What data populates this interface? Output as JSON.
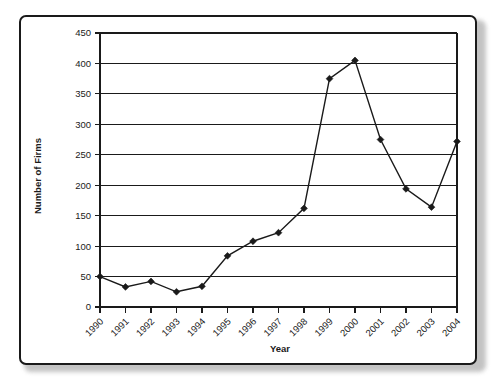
{
  "chart_data": {
    "type": "line",
    "title": "",
    "xlabel": "Year",
    "ylabel": "Number of Firms",
    "categories": [
      "1990",
      "1991",
      "1992",
      "1993",
      "1994",
      "1995",
      "1996",
      "1997",
      "1998",
      "1999",
      "2000",
      "2001",
      "2002",
      "2003",
      "2004"
    ],
    "values": [
      50,
      33,
      42,
      25,
      34,
      84,
      108,
      122,
      162,
      375,
      405,
      275,
      194,
      164,
      272
    ],
    "series": [
      {
        "name": "Number of Firms",
        "values": [
          50,
          33,
          42,
          25,
          34,
          84,
          108,
          122,
          162,
          375,
          405,
          275,
          194,
          164,
          272
        ]
      }
    ],
    "ylim": [
      0,
      450
    ],
    "yticks": [
      0,
      50,
      100,
      150,
      200,
      250,
      300,
      350,
      400,
      450
    ],
    "ytick_labels": [
      "0",
      "50",
      "100",
      "150",
      "200",
      "250",
      "300",
      "350",
      "400",
      "450"
    ],
    "grid": "horizontal",
    "legend": "none",
    "marker": "diamond",
    "line_color": "#1a1a1a",
    "marker_color": "#1a1a1a",
    "xtick_rotation": -45
  },
  "figure": {
    "border_color": "#1a1a1a",
    "background": "#ffffff"
  }
}
